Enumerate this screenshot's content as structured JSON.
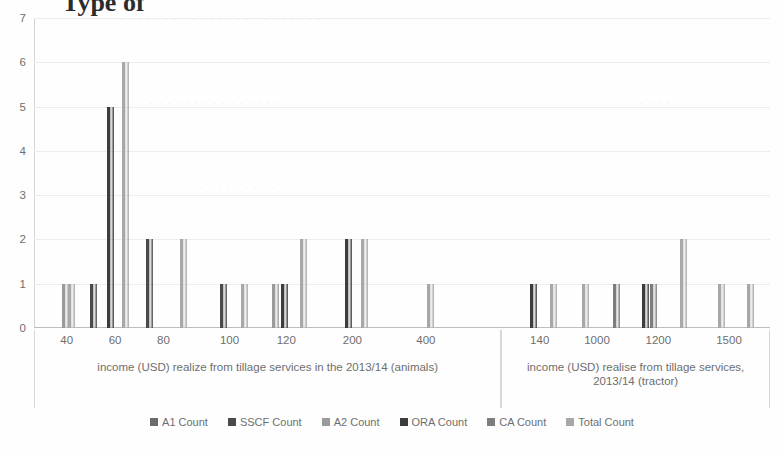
{
  "title_fragment": "Type of",
  "axis": {
    "y_ticks": [
      "0",
      "1",
      "2",
      "3",
      "4",
      "5",
      "6",
      "7"
    ],
    "y_min": 0,
    "y_max": 7
  },
  "groups": [
    {
      "label": "income (USD)  realize from tillage services in the 2013/14 (animals)",
      "tick_labels": [
        "40",
        "60",
        "80",
        "100",
        "120",
        "200",
        "400"
      ]
    },
    {
      "label": "income (USD) realise from tillage services, 2013/14 (tractor)",
      "tick_labels": [
        "140",
        "1000",
        "1200",
        "1500"
      ]
    }
  ],
  "legend": {
    "items": [
      {
        "label": "A1 Count",
        "color": "#6b6b6b"
      },
      {
        "label": "SSCF Count",
        "color": "#4a4a4a"
      },
      {
        "label": "A2 Count",
        "color": "#9a9a9a"
      },
      {
        "label": "ORA Count",
        "color": "#3d3d3d"
      },
      {
        "label": "CA  Count",
        "color": "#7d7d7d"
      },
      {
        "label": "Total  Count",
        "color": "#a8a8a8"
      }
    ]
  },
  "chart_data": {
    "type": "bar",
    "title": "",
    "xlabel": "income (USD) realize/realise from tillage services, 2013/14",
    "ylabel": "Count",
    "ylim": [
      0,
      7
    ],
    "grid": true,
    "legend_position": "bottom",
    "panels": [
      {
        "name": "animals",
        "xlabel": "income (USD)  realize from tillage services in the 2013/14 (animals)",
        "tick_labels": [
          "40",
          "60",
          "80",
          "100",
          "120",
          "200",
          "400"
        ],
        "bars": [
          {
            "x_pct": 6.0,
            "series": "A2 Count",
            "value": 1,
            "color": "#9a9a9a"
          },
          {
            "x_pct": 7.3,
            "series": "Total  Count",
            "value": 1,
            "color": "#a8a8a8"
          },
          {
            "x_pct": 12.0,
            "series": "SSCF Count",
            "value": 1,
            "color": "#4a4a4a"
          },
          {
            "x_pct": 15.6,
            "series": "ORA Count",
            "value": 5,
            "color": "#3d3d3d"
          },
          {
            "x_pct": 18.9,
            "series": "Total  Count",
            "value": 6,
            "color": "#a8a8a8"
          },
          {
            "x_pct": 24.0,
            "series": "SSCF Count",
            "value": 2,
            "color": "#4a4a4a"
          },
          {
            "x_pct": 31.2,
            "series": "Total  Count",
            "value": 2,
            "color": "#a8a8a8"
          },
          {
            "x_pct": 39.8,
            "series": "SSCF Count",
            "value": 1,
            "color": "#4a4a4a"
          },
          {
            "x_pct": 44.2,
            "series": "Total  Count",
            "value": 1,
            "color": "#a8a8a8"
          },
          {
            "x_pct": 51.0,
            "series": "A2 Count",
            "value": 1,
            "color": "#9a9a9a"
          },
          {
            "x_pct": 52.8,
            "series": "ORA Count",
            "value": 1,
            "color": "#3d3d3d"
          },
          {
            "x_pct": 57.0,
            "series": "Total  Count",
            "value": 2,
            "color": "#a8a8a8"
          },
          {
            "x_pct": 66.5,
            "series": "ORA Count",
            "value": 2,
            "color": "#3d3d3d"
          },
          {
            "x_pct": 70.0,
            "series": "Total  Count",
            "value": 2,
            "color": "#a8a8a8"
          },
          {
            "x_pct": 84.0,
            "series": "Total  Count",
            "value": 1,
            "color": "#a8a8a8"
          }
        ]
      },
      {
        "name": "tractor",
        "xlabel": "income (USD) realise from tillage services, 2013/14 (tractor)",
        "tick_labels": [
          "140",
          "1000",
          "1200",
          "1500"
        ],
        "bars": [
          {
            "x_pct": 10.5,
            "series": "ORA Count",
            "value": 1,
            "color": "#3d3d3d"
          },
          {
            "x_pct": 18.0,
            "series": "Total  Count",
            "value": 1,
            "color": "#a8a8a8"
          },
          {
            "x_pct": 30.0,
            "series": "Total  Count",
            "value": 1,
            "color": "#a8a8a8"
          },
          {
            "x_pct": 41.5,
            "series": "CA  Count",
            "value": 1,
            "color": "#7d7d7d"
          },
          {
            "x_pct": 52.5,
            "series": "ORA Count",
            "value": 1,
            "color": "#3d3d3d"
          },
          {
            "x_pct": 55.5,
            "series": "CA  Count",
            "value": 1,
            "color": "#7d7d7d"
          },
          {
            "x_pct": 66.5,
            "series": "Total  Count",
            "value": 2,
            "color": "#a8a8a8"
          },
          {
            "x_pct": 80.5,
            "series": "Total  Count",
            "value": 1,
            "color": "#a8a8a8"
          },
          {
            "x_pct": 91.5,
            "series": "Total  Count",
            "value": 1,
            "color": "#a8a8a8"
          }
        ]
      }
    ]
  }
}
